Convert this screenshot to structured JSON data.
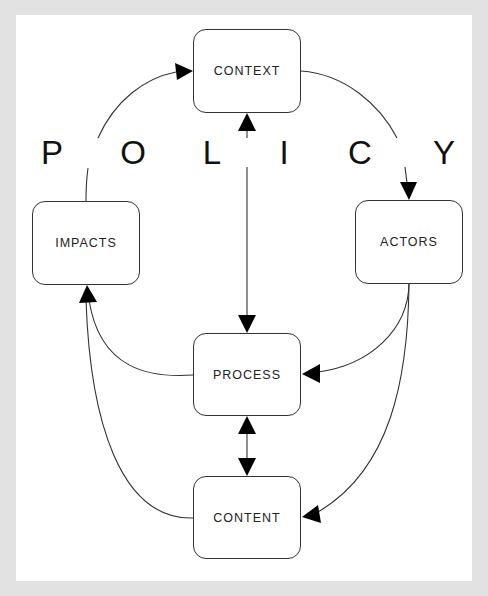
{
  "title_word": "POLICY",
  "policy_letters": [
    {
      "char": "P",
      "x": 52
    },
    {
      "char": "O",
      "x": 133
    },
    {
      "char": "L",
      "x": 212
    },
    {
      "char": "I",
      "x": 284
    },
    {
      "char": "C",
      "x": 360
    },
    {
      "char": "Y",
      "x": 444
    }
  ],
  "nodes": {
    "context": {
      "label": "CONTEXT"
    },
    "impacts": {
      "label": "IMPACTS"
    },
    "actors": {
      "label": "ACTORS"
    },
    "process": {
      "label": "PROCESS"
    },
    "content": {
      "label": "CONTENT"
    }
  },
  "edges": [
    {
      "from": "IMPACTS",
      "to": "CONTEXT",
      "type": "curved",
      "arrow": "end"
    },
    {
      "from": "CONTEXT",
      "to": "ACTORS",
      "type": "curved",
      "arrow": "end"
    },
    {
      "from": "CONTEXT",
      "to": "PROCESS",
      "type": "straight",
      "arrow": "both"
    },
    {
      "from": "ACTORS",
      "to": "PROCESS",
      "type": "curved",
      "arrow": "end"
    },
    {
      "from": "ACTORS",
      "to": "CONTENT",
      "type": "curved",
      "arrow": "end"
    },
    {
      "from": "PROCESS",
      "to": "IMPACTS",
      "type": "curved",
      "arrow": "end"
    },
    {
      "from": "CONTENT",
      "to": "IMPACTS",
      "type": "curved",
      "arrow": "end"
    },
    {
      "from": "PROCESS",
      "to": "CONTENT",
      "type": "straight",
      "arrow": "both"
    }
  ],
  "colors": {
    "background": "#e2e2e2",
    "panel": "#ffffff",
    "stroke": "#333333",
    "text": "#222222"
  }
}
